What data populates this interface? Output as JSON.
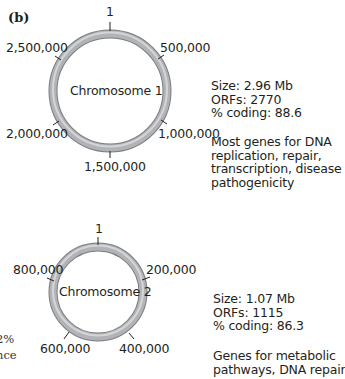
{
  "panel_label": "(b)",
  "ring_color": "#a7a9ac",
  "ring_edge_color": "#7a7c7f",
  "chromosomes": [
    {
      "name": "Chromosome 1",
      "ticks": [
        "1",
        "500,000",
        "1,000,000",
        "1,500,000",
        "2,000,000",
        "2,500,000"
      ],
      "size": "Size: 2.96 Mb",
      "orfs": "ORFs: 2770",
      "coding": "% coding: 88.6",
      "description": [
        "Most genes for DNA",
        "replication, repair,",
        "transcription, disease",
        "pathogenicity"
      ]
    },
    {
      "name": "Chromosome 2",
      "ticks": [
        "1",
        "200,000",
        "400,000",
        "600,000",
        "800,000"
      ],
      "size": "Size: 1.07 Mb",
      "orfs": "ORFs: 1115",
      "coding": "% coding: 86.3",
      "description": [
        "Genes for metabolic",
        "pathways, DNA repair"
      ]
    }
  ],
  "clipped_left_text": [
    "2%",
    "nce",
    "."
  ]
}
